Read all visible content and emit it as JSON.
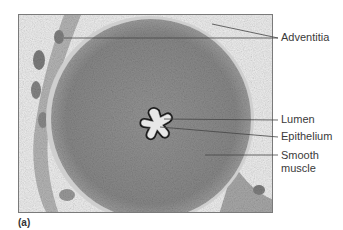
{
  "figure": {
    "panel_letter": "(a)",
    "labels": [
      {
        "id": "adventitia",
        "text": "Adventitia"
      },
      {
        "id": "lumen",
        "text": "Lumen"
      },
      {
        "id": "epithelium",
        "text": "Epithelium"
      },
      {
        "id": "smooth-muscle",
        "text_line1": "Smooth",
        "text_line2": "muscle"
      }
    ],
    "colors": {
      "background_tissue": "#ececec",
      "muscle": "#8e8e8e",
      "muscle_dark": "#6f6f6f",
      "epithelium": "#1e1e1e",
      "lumen": "#e6e6e6",
      "leader_line": "#444444",
      "label_text": "#3a3a3a"
    }
  }
}
